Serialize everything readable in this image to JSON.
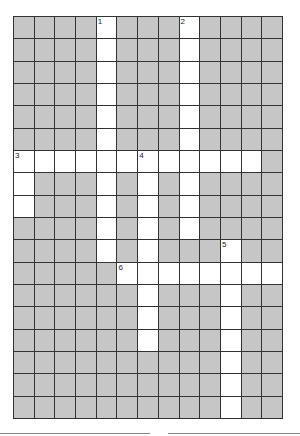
{
  "puzzle": {
    "cols": 13,
    "rows": 18,
    "colors": {
      "block": "#c6c6c6",
      "open": "#ffffff",
      "grid_line": "#333333"
    },
    "entries": [
      {
        "number": "1",
        "direction": "down",
        "row": 0,
        "col": 4,
        "length": 11
      },
      {
        "number": "2",
        "direction": "down",
        "row": 0,
        "col": 8,
        "length": 10
      },
      {
        "number": "3",
        "direction": "across",
        "row": 6,
        "col": 0,
        "length": 12
      },
      {
        "number": "3",
        "direction": "down",
        "row": 6,
        "col": 0,
        "length": 3
      },
      {
        "number": "4",
        "direction": "down",
        "row": 6,
        "col": 6,
        "length": 9
      },
      {
        "number": "5",
        "direction": "down",
        "row": 10,
        "col": 10,
        "length": 8
      },
      {
        "number": "6",
        "direction": "across",
        "row": 11,
        "col": 5,
        "length": 8
      }
    ],
    "numbers": [
      {
        "label": "1",
        "row": 0,
        "col": 4
      },
      {
        "label": "2",
        "row": 0,
        "col": 8
      },
      {
        "label": "3",
        "row": 6,
        "col": 0
      },
      {
        "label": "4",
        "row": 6,
        "col": 6
      },
      {
        "label": "5",
        "row": 10,
        "col": 10
      },
      {
        "label": "6",
        "row": 11,
        "col": 5
      }
    ]
  },
  "answer_lines": [
    {
      "left": 0,
      "width": 150
    },
    {
      "left": 168,
      "width": 132
    }
  ]
}
